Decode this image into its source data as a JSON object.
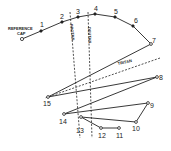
{
  "diagram": {
    "type": "color-vision-cap-arrangement",
    "reference_cap_label": "REFERENCE CAP",
    "cap_labels": [
      "1",
      "2",
      "3",
      "4",
      "5",
      "6",
      "7",
      "8",
      "9",
      "10",
      "11",
      "12",
      "13",
      "14",
      "15"
    ],
    "confusion_axes": [
      {
        "name": "PROTAN",
        "label": "PROTAN"
      },
      {
        "name": "DEUTAN",
        "label": "DEUTAN"
      },
      {
        "name": "TRITAN",
        "label": "TRITAN"
      }
    ],
    "arrangement_order": [
      "ref",
      "1",
      "2",
      "3",
      "4",
      "5",
      "6",
      "7",
      "15",
      "8",
      "14",
      "9",
      "10",
      "13",
      "12",
      "11"
    ]
  },
  "colors": {
    "line": "#222222",
    "background": "#ffffff"
  }
}
